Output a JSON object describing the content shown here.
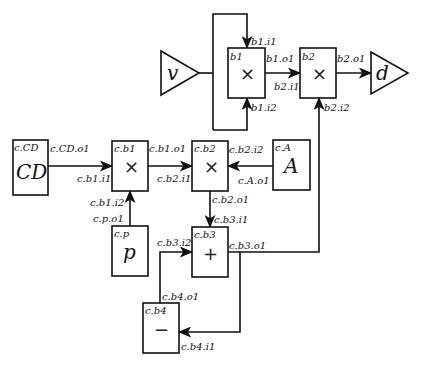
{
  "diagram": {
    "top": {
      "v": {
        "label": "v"
      },
      "d": {
        "label": "d"
      },
      "b1": {
        "name": "b1",
        "op": "×",
        "i1": "b1.i1",
        "i2": "b1.i2",
        "o1": "b1.o1"
      },
      "b2": {
        "name": "b2",
        "op": "×",
        "i1": "b2.i1",
        "i2": "b2.i2",
        "o1": "b2.o1"
      }
    },
    "sub": {
      "CD": {
        "name": "c.CD",
        "symbol": "CD",
        "o1": "c.CD.o1"
      },
      "b1": {
        "name": "c.b1",
        "op": "×",
        "i1": "c.b1.i1",
        "i2": "c.b1.i2",
        "o1": "c.b1.o1"
      },
      "b2": {
        "name": "c.b2",
        "op": "×",
        "i1": "c.b2.i1",
        "i2": "c.b2.i2",
        "o1": "c.b2.o1"
      },
      "A": {
        "name": "c.A",
        "symbol": "A",
        "o1": "c.A.o1"
      },
      "p": {
        "name": "c.p",
        "symbol": "p",
        "o1": "c.p.o1"
      },
      "b3": {
        "name": "c.b3",
        "op": "+",
        "i1": "c.b3.i1",
        "i2": "c.b3.i2",
        "o1": "c.b3.o1"
      },
      "b4": {
        "name": "c.b4",
        "op": "−",
        "i1": "c.b4.i1",
        "o1": "c.b4.o1"
      }
    }
  }
}
